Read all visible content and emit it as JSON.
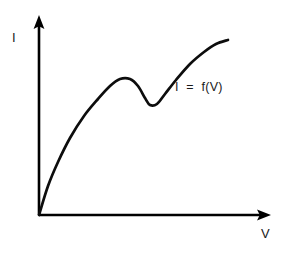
{
  "figure": {
    "background_color": "#ffffff",
    "ink_color": "#000000",
    "y_axis_label": "I",
    "x_axis_label": "V",
    "curve_annotation": "I  =  f(V)"
  },
  "chart_data": {
    "type": "line",
    "title": "",
    "subtitle": "",
    "xlabel": "V",
    "ylabel": "I",
    "grid": false,
    "legend": "",
    "annotations": [
      {
        "text": "I  =  f(V)",
        "x_px": 175,
        "y_px": 81
      }
    ],
    "axes": {
      "origin_px": [
        39,
        215
      ],
      "y_axis_tip_px": [
        39,
        16
      ],
      "x_axis_tip_px": [
        271,
        215
      ],
      "arrowheads": [
        "y-up",
        "x-right"
      ],
      "tick_labels_x": [],
      "tick_labels_y": [],
      "xlim": [
        0,
        1
      ],
      "ylim": [
        0,
        1
      ]
    },
    "series": [
      {
        "name": "I = f(V)",
        "color": "#0d0d0d",
        "description": "N-shaped negative differential resistance characteristic: steep rise from origin, local maximum, dip to local minimum, then renewed rise",
        "points_px": [
          [
            39,
            215
          ],
          [
            48,
            186
          ],
          [
            58,
            162
          ],
          [
            70,
            138
          ],
          [
            84,
            116
          ],
          [
            98,
            99
          ],
          [
            110,
            86
          ],
          [
            120,
            79
          ],
          [
            130,
            79
          ],
          [
            138,
            86
          ],
          [
            145,
            98
          ],
          [
            150,
            105
          ],
          [
            157,
            104
          ],
          [
            165,
            94
          ],
          [
            176,
            80
          ],
          [
            190,
            64
          ],
          [
            204,
            52
          ],
          [
            216,
            44
          ],
          [
            228,
            40
          ]
        ],
        "features": {
          "local_max_px": [
            120,
            78
          ],
          "local_min_px": [
            150,
            106
          ],
          "end_px": [
            228,
            40
          ]
        }
      }
    ]
  }
}
